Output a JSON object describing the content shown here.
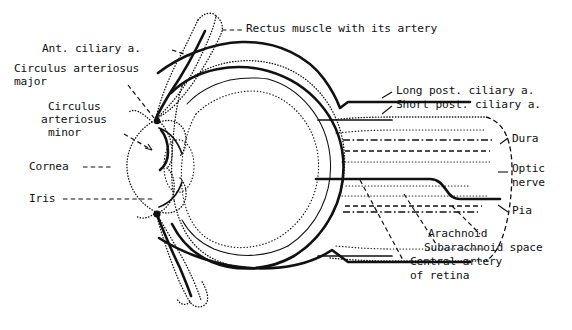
{
  "figure": {
    "background_color": "#ffffff",
    "ink_color": "#111111",
    "width": 572,
    "height": 330
  },
  "labels": {
    "rectus_muscle": "Rectus muscle with its artery",
    "ant_ciliary": "Ant. ciliary a.",
    "circulus_major_l1": "Circulus arteriosus",
    "circulus_major_l2": "major",
    "circulus_minor_l1": "Circulus",
    "circulus_minor_l2": "arteriosus",
    "circulus_minor_l3": "minor",
    "cornea": "Cornea",
    "iris": "Iris",
    "long_post_ciliary": "Long post. ciliary a.",
    "short_post_ciliary": "Short post. ciliary a.",
    "dura": "Dura",
    "optic_nerve_l1": "Optic",
    "optic_nerve_l2": "nerve",
    "pia": "Pia",
    "arachnoid": "Arachnoid",
    "subarachnoid_space": "Subarachnoid space",
    "central_artery_l1": "Central artery",
    "central_artery_l2": "of retina"
  },
  "structures": [
    {
      "name": "eyeball-globe",
      "style": "dotted-outline"
    },
    {
      "name": "sclera",
      "style": "solid-thick-arc"
    },
    {
      "name": "choroid-vessel",
      "style": "thin-wavy-arc"
    },
    {
      "name": "retina",
      "style": "dotted-arc"
    },
    {
      "name": "cornea",
      "style": "dotted-bulge"
    },
    {
      "name": "iris",
      "style": "dotted-leaf"
    },
    {
      "name": "lens",
      "style": "dotted-oval"
    },
    {
      "name": "rectus-muscle-superior",
      "style": "dotted-strap"
    },
    {
      "name": "rectus-muscle-inferior",
      "style": "dotted-strap"
    },
    {
      "name": "optic-nerve-sheath",
      "style": "dotted-tube"
    },
    {
      "name": "dura-mater",
      "style": "dash-dot-line"
    },
    {
      "name": "arachnoid-mater",
      "style": "dashed-line"
    },
    {
      "name": "pia-mater",
      "style": "dotted-line"
    },
    {
      "name": "central-artery-of-retina",
      "style": "solid-thick-line"
    },
    {
      "name": "long-posterior-ciliary-artery",
      "style": "solid-thick-line"
    },
    {
      "name": "short-posterior-ciliary-artery",
      "style": "solid-line"
    },
    {
      "name": "anterior-ciliary-artery",
      "style": "solid-thick-line"
    },
    {
      "name": "circulus-arteriosus-major",
      "style": "junction-dot"
    },
    {
      "name": "circulus-arteriosus-minor",
      "style": "junction-dot"
    }
  ]
}
